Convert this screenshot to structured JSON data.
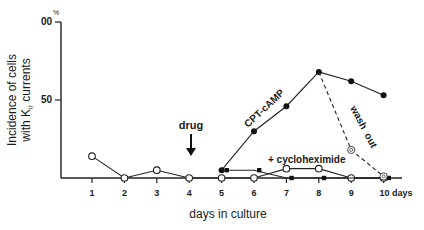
{
  "chart_data": {
    "type": "line",
    "title": "",
    "xlabel": "days in culture",
    "ylabel_line1": "Incidence of cells",
    "ylabel_line2": "with K",
    "ylabel_sub": "ir",
    "ylabel_line2_end": " currents",
    "y_unit": "%",
    "ylim": [
      0,
      100
    ],
    "y_ticks": [
      {
        "value": 100,
        "label": "00"
      },
      {
        "value": 50,
        "label": "50"
      }
    ],
    "x": [
      1,
      2,
      3,
      4,
      5,
      6,
      7,
      8,
      9,
      10
    ],
    "x_tick_labels": [
      "1",
      "2",
      "3",
      "4",
      "5",
      "6",
      "7",
      "8",
      "9",
      "10 days"
    ],
    "grid": false,
    "series": [
      {
        "name": "control",
        "marker": "open-circle",
        "style": "solid",
        "x": [
          1,
          2,
          3,
          4,
          5,
          6,
          7,
          8,
          9,
          10
        ],
        "values": [
          14,
          0,
          5,
          0,
          0,
          0,
          6,
          6,
          0,
          0
        ]
      },
      {
        "name": "CPT-cAMP",
        "marker": "filled-circle",
        "style": "solid",
        "x": [
          5,
          6,
          7,
          8,
          9,
          10
        ],
        "values": [
          5,
          30,
          46,
          68,
          62,
          53
        ]
      },
      {
        "name": "+ cycloheximide",
        "marker": "filled-square",
        "style": "solid",
        "x": [
          5,
          6,
          7,
          8,
          10
        ],
        "values": [
          5,
          5,
          0,
          0,
          0
        ]
      },
      {
        "name": "wash out",
        "marker": "dotted-circle",
        "style": "dashed",
        "x": [
          8,
          9,
          10
        ],
        "values": [
          68,
          18,
          1
        ]
      }
    ],
    "annotations": [
      {
        "text": "drug",
        "x": 4,
        "arrow": "down"
      },
      {
        "text": "CPT-cAMP"
      },
      {
        "text": "+ cycloheximide"
      },
      {
        "text": "wash  out"
      }
    ]
  }
}
